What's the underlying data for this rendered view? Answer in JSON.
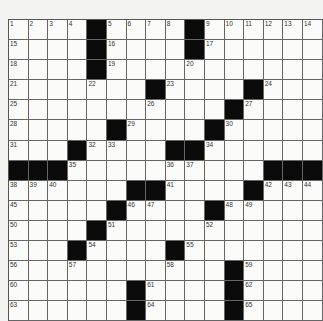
{
  "puzzle": {
    "cols": 16,
    "rows": 15,
    "colors": {
      "black": "#0a0a0a",
      "white": "#fbfbf9",
      "line": "#666666",
      "paper": "#f3f3f1"
    },
    "grid": [
      [
        "1",
        "2",
        "3",
        "4",
        "#",
        "5",
        "6",
        "7",
        "8",
        "#",
        "9",
        "10",
        "11",
        "12",
        "13",
        "14"
      ],
      [
        "15",
        "",
        "",
        "",
        "#",
        "16",
        "",
        "",
        "",
        "#",
        "17",
        "",
        "",
        "",
        "",
        ""
      ],
      [
        "18",
        "",
        "",
        "",
        "#",
        "19",
        "",
        "",
        "",
        "20",
        "",
        "",
        "",
        "",
        "",
        ""
      ],
      [
        "21",
        "",
        "",
        "",
        "22",
        "",
        "",
        "#",
        "23",
        "",
        "",
        "",
        "#",
        "24",
        "",
        ""
      ],
      [
        "25",
        "",
        "",
        "",
        "",
        "",
        "",
        "26",
        "",
        "",
        "",
        "#",
        "27",
        "",
        "",
        ""
      ],
      [
        "28",
        "",
        "",
        "",
        "",
        "#",
        "29",
        "",
        "",
        "",
        "#",
        "30",
        "",
        "",
        "",
        ""
      ],
      [
        "31",
        "",
        "",
        "#",
        "32",
        "33",
        "",
        "",
        "#",
        "#",
        "34",
        "",
        "",
        "",
        "",
        ""
      ],
      [
        "#",
        "#",
        "#",
        "35",
        "",
        "",
        "",
        "",
        "36",
        "37",
        "",
        "",
        "",
        "#",
        "#",
        "#"
      ],
      [
        "38",
        "39",
        "40",
        "",
        "",
        "",
        "#",
        "#",
        "41",
        "",
        "",
        "",
        "#",
        "42",
        "43",
        "44"
      ],
      [
        "45",
        "",
        "",
        "",
        "",
        "#",
        "46",
        "47",
        "",
        "",
        "#",
        "48",
        "49",
        "",
        "",
        ""
      ],
      [
        "50",
        "",
        "",
        "",
        "#",
        "51",
        "",
        "",
        "",
        "",
        "52",
        "",
        "",
        "",
        "",
        ""
      ],
      [
        "53",
        "",
        "",
        "#",
        "54",
        "",
        "",
        "",
        "#",
        "55",
        "",
        "",
        "",
        "",
        "",
        ""
      ],
      [
        "56",
        "",
        "",
        "57",
        "",
        "",
        "",
        "",
        "58",
        "",
        "",
        "#",
        "59",
        "",
        "",
        ""
      ],
      [
        "60",
        "",
        "",
        "",
        "",
        "",
        "#",
        "61",
        "",
        "",
        "",
        "#",
        "62",
        "",
        "",
        ""
      ],
      [
        "63",
        "",
        "",
        "",
        "",
        "",
        "#",
        "64",
        "",
        "",
        "",
        "#",
        "65",
        "",
        "",
        ""
      ]
    ]
  }
}
